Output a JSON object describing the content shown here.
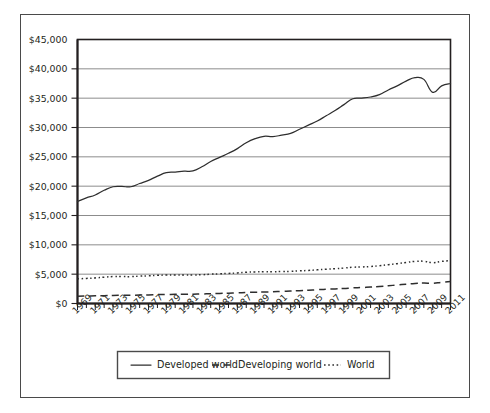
{
  "chart_data": {
    "type": "line",
    "title": "",
    "subtitle": "",
    "xlabel": "",
    "ylabel": "",
    "xlim": [
      1969,
      2011
    ],
    "ylim": [
      0,
      45000
    ],
    "grid": true,
    "legend_position": "bottom",
    "y_ticks": [
      0,
      5000,
      10000,
      15000,
      20000,
      25000,
      30000,
      35000,
      40000,
      45000
    ],
    "y_tick_labels": [
      "$0",
      "$5,000",
      "$10,000",
      "$15,000",
      "$20,000",
      "$25,000",
      "$30,000",
      "$35,000",
      "$40,000",
      "$45,000"
    ],
    "x_ticks": [
      1969,
      1971,
      1973,
      1975,
      1977,
      1979,
      1981,
      1983,
      1985,
      1987,
      1989,
      1991,
      1993,
      1995,
      1997,
      1999,
      2001,
      2003,
      2005,
      2007,
      2009,
      2011
    ],
    "x_tick_labels": [
      "1969",
      "1971",
      "1973",
      "1975",
      "1977",
      "1979",
      "1981",
      "1983",
      "1985",
      "1987",
      "1989",
      "1991",
      "1993",
      "1995",
      "1997",
      "1999",
      "2001",
      "2003",
      "2005",
      "2007",
      "2009",
      "2011"
    ],
    "x_minor_ticks_all_years": true,
    "x": [
      1969,
      1970,
      1971,
      1972,
      1973,
      1974,
      1975,
      1976,
      1977,
      1978,
      1979,
      1980,
      1981,
      1982,
      1983,
      1984,
      1985,
      1986,
      1987,
      1988,
      1989,
      1990,
      1991,
      1992,
      1993,
      1994,
      1995,
      1996,
      1997,
      1998,
      1999,
      2000,
      2001,
      2002,
      2003,
      2004,
      2005,
      2006,
      2007,
      2008,
      2009,
      2010,
      2011
    ],
    "series": [
      {
        "name": "Developed world",
        "style": "solid",
        "color": "#2e2e2e",
        "values": [
          17400,
          18000,
          18500,
          19300,
          19900,
          19950,
          19900,
          20450,
          21000,
          21700,
          22300,
          22400,
          22550,
          22600,
          23300,
          24200,
          24900,
          25600,
          26400,
          27400,
          28100,
          28500,
          28450,
          28700,
          29000,
          29700,
          30400,
          31100,
          32000,
          32900,
          33900,
          34900,
          35000,
          35200,
          35600,
          36400,
          37100,
          37900,
          38500,
          38200,
          36000,
          37100,
          37500
        ]
      },
      {
        "name": "Developing world",
        "style": "dashed",
        "color": "#2e2e2e",
        "values": [
          1250,
          1270,
          1300,
          1330,
          1380,
          1390,
          1400,
          1440,
          1470,
          1510,
          1540,
          1560,
          1580,
          1590,
          1620,
          1670,
          1710,
          1760,
          1810,
          1880,
          1930,
          1960,
          2000,
          2060,
          2120,
          2190,
          2260,
          2350,
          2440,
          2490,
          2560,
          2660,
          2720,
          2800,
          2900,
          3030,
          3150,
          3290,
          3430,
          3490,
          3450,
          3620,
          3750
        ]
      },
      {
        "name": "World",
        "style": "dotted",
        "color": "#2e2e2e",
        "values": [
          4200,
          4280,
          4360,
          4480,
          4600,
          4600,
          4580,
          4660,
          4720,
          4800,
          4860,
          4860,
          4870,
          4860,
          4900,
          5000,
          5060,
          5130,
          5210,
          5320,
          5390,
          5420,
          5410,
          5450,
          5480,
          5560,
          5640,
          5740,
          5850,
          5930,
          6040,
          6180,
          6230,
          6310,
          6440,
          6620,
          6790,
          6990,
          7180,
          7200,
          6950,
          7180,
          7330
        ]
      }
    ]
  },
  "legend": {
    "items": [
      {
        "label": "Developed world",
        "style": "solid"
      },
      {
        "label": "Developing world",
        "style": "dashed"
      },
      {
        "label": "World",
        "style": "dotted"
      }
    ]
  }
}
